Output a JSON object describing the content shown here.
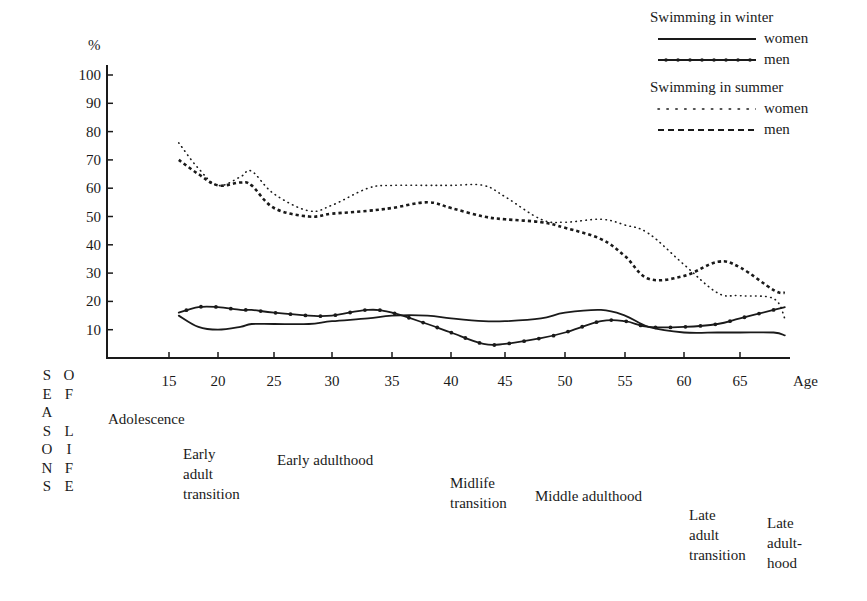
{
  "chart_data": {
    "type": "line",
    "title": "",
    "ylabel": "%",
    "xlabel": "Age",
    "ylim": [
      0,
      100
    ],
    "yticks": [
      10,
      20,
      30,
      40,
      50,
      60,
      70,
      80,
      90,
      100
    ],
    "xticks": [
      15,
      20,
      25,
      30,
      35,
      40,
      45,
      50,
      55,
      60,
      65
    ],
    "grid": false,
    "legend_position": "top-right",
    "legend_groups": [
      {
        "title": "Swimming in winter",
        "entries": [
          "women",
          "men"
        ]
      },
      {
        "title": "Swimming in summer",
        "entries": [
          "women",
          "men"
        ]
      }
    ],
    "x": [
      16,
      18,
      20,
      22,
      23,
      25,
      28,
      30,
      33,
      35,
      38,
      40,
      43,
      45,
      48,
      50,
      53,
      55,
      57,
      60,
      63,
      65,
      68,
      69
    ],
    "series": [
      {
        "name": "Swimming in winter - women",
        "style": "solid",
        "values": [
          15,
          11,
          10,
          11,
          12,
          12,
          12,
          13,
          14,
          15,
          15,
          14,
          13,
          13,
          14,
          16,
          17,
          15,
          11,
          9,
          9,
          9,
          9,
          8
        ]
      },
      {
        "name": "Swimming in winter - men",
        "style": "solid-marked",
        "values": [
          16,
          18,
          18,
          17,
          17,
          16,
          15,
          15,
          17,
          16,
          12,
          9,
          5,
          5,
          7,
          9,
          13,
          13,
          11,
          11,
          12,
          14,
          17,
          18
        ]
      },
      {
        "name": "Swimming in summer - women",
        "style": "dotted",
        "values": [
          76,
          67,
          61,
          64,
          66,
          58,
          52,
          54,
          60,
          61,
          61,
          61,
          61,
          57,
          49,
          48,
          49,
          47,
          44,
          33,
          23,
          22,
          21,
          14
        ]
      },
      {
        "name": "Swimming in summer - men",
        "style": "dashed",
        "values": [
          70,
          65,
          61,
          62,
          61,
          53,
          50,
          51,
          52,
          53,
          55,
          53,
          50,
          49,
          48,
          46,
          42,
          36,
          28,
          29,
          34,
          32,
          24,
          23
        ]
      }
    ],
    "annotations": {
      "side_label": "SEASONS OF LIFE",
      "life_stages": [
        "Adolescence",
        "Early adult transition",
        "Early adulthood",
        "Midlife transition",
        "Middle adulthood",
        "Late adult transition",
        "Late adulthood"
      ]
    }
  },
  "axis": {
    "y_unit": "%",
    "x_title": "Age",
    "y_ticks": [
      "100",
      "90",
      "80",
      "70",
      "60",
      "50",
      "40",
      "30",
      "20",
      "10"
    ],
    "x_ticks": [
      "15",
      "20",
      "25",
      "30",
      "35",
      "40",
      "45",
      "50",
      "55",
      "60",
      "65"
    ]
  },
  "legend": {
    "winter_title": "Swimming in winter",
    "winter_women": "women",
    "winter_men": "men",
    "summer_title": "Swimming in summer",
    "summer_women": "women",
    "summer_men": "men"
  },
  "seasons": {
    "col1": [
      "S",
      "E",
      "A",
      "S",
      "O",
      "N",
      "S"
    ],
    "col2": [
      "O",
      "F",
      "",
      "L",
      "I",
      "F",
      "E"
    ]
  },
  "stages": {
    "adolescence": "Adolescence",
    "early_adult_transition": "Early\nadult\ntransition",
    "early_adulthood": "Early adulthood",
    "midlife_transition": "Midlife\ntransition",
    "middle_adulthood": "Middle adulthood",
    "late_adult_transition": "Late\nadult\ntransition",
    "late_adulthood": "Late\nadult-\nhood"
  },
  "colors": {
    "ink": "#1a1a1a",
    "background": "#ffffff"
  }
}
